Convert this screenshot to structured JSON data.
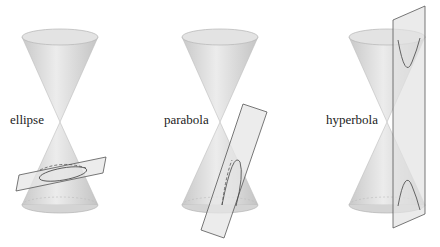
{
  "figure": {
    "panels": [
      {
        "label": "ellipse"
      },
      {
        "label": "parabola"
      },
      {
        "label": "hyperbola"
      }
    ]
  },
  "colors": {
    "background": "#ffffff",
    "cone_fill": "#d9d9d9",
    "cone_edge": "#b8b8b8",
    "plane_fill": "#e6e6e6",
    "plane_edge": "#555555",
    "curve": "#444444",
    "text": "#222222"
  }
}
